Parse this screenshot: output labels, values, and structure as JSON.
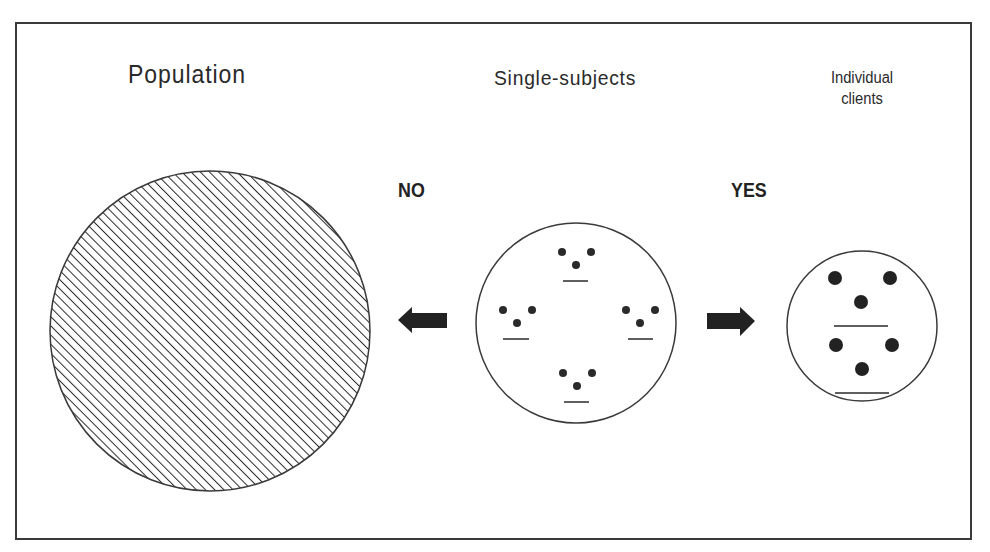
{
  "diagram": {
    "titles": {
      "population": "Population",
      "single_subjects": "Single-subjects",
      "individual_clients": "Individual clients"
    },
    "arrows": {
      "left_label": "NO",
      "left_direction": "left",
      "right_label": "YES",
      "right_direction": "right"
    },
    "shapes": {
      "population_circle": {
        "fill": "diagonal-hatch",
        "cx": 210,
        "cy": 331,
        "r": 160
      },
      "single_subjects_circle": {
        "groups": 4,
        "dots_per_group": 3,
        "cx": 576,
        "cy": 323,
        "r": 100
      },
      "individual_clients_circle": {
        "groups": 2,
        "dots_per_group": 3,
        "cx": 862,
        "cy": 323,
        "r": 75
      }
    },
    "colors": {
      "stroke": "#3a3a3a",
      "fill_dark": "#222222",
      "background": "#ffffff"
    }
  }
}
